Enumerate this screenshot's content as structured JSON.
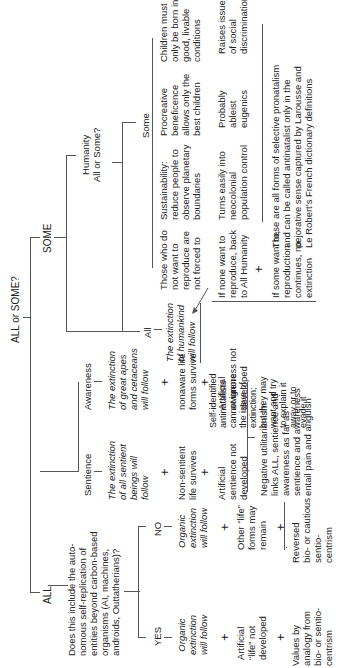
{
  "root": {
    "label": "ALL or SOME?"
  },
  "all": {
    "label": "ALL",
    "question": "Does this include the auto-\nnomous self-replication of\nentities beyond carbon-based\norganisms (AI, machines,\nandroids, Outtatherians)?",
    "yes": {
      "label": "YES",
      "items": [
        "Organic\nextinction\nwill follow",
        "Artificial\n“life” not\ndeveloped",
        "Values by\nanalogy from\nbio- or sentio-\ncentrism"
      ]
    },
    "no": {
      "label": "NO",
      "items": [
        "Organic\nextinction\nwill follow",
        "Other “life”\nforms may\nremain",
        "Reversed\nbio- or cautious\nsentio-\ncentrism"
      ]
    },
    "sentience": {
      "label": "Sentience",
      "items": [
        "The extinction\nof all sentient\nbeings will\nfollow",
        "Non-sentient\nlife survives",
        "Artificial\nsentience not\ndeveloped"
      ]
    },
    "awareness": {
      "label": "Awareness",
      "items": [
        "The extinction\nof great apes\nand cetaceans\nwill follow",
        "nonaware life\nforms survive",
        "Artificial\nawareness not\ndeveloped"
      ]
    },
    "negative_utilitarianism": "Negative utilitarianism\nlinks ALL, sentience and\nawareness as far as\nsentience and awareness\nentail pain and anguish"
  },
  "some": {
    "label": "SOME",
    "humanity": {
      "label": "Humanity\nAll or Some?"
    },
    "all_branch": {
      "label": "All",
      "result": "The extinction\nof humankind\nwill follow",
      "note": "Self-identified\nantinatalists\ncannot ignore\nthe issue of\nextinction;\nbut they may\nwant and try\nto explain it\naway or to\nevade it"
    },
    "some_branch": {
      "label": "Some",
      "options": [
        {
          "text": "Those who do\nnot want to\nreproduce are\nnot forced to"
        },
        {
          "text": "Sustainability:\nreduce people to\nobserve planetary\nboundaries",
          "sub": "Turns easily into\nneocolonial\npopulation control"
        },
        {
          "text": "Procreative\nbeneficence\nallows only the\nbest children",
          "sub": "Probably\nableist\neugenics"
        },
        {
          "text": "Children must\nonly be born into\ngood, livable\nconditions",
          "sub": "Raises issues\nof social\ndiscrimination"
        }
      ],
      "if_none": "If none want to\nreproduce, back\nto All Humanity",
      "if_some": "If some want to,\nreproduction\ncontinues, no\nextinction",
      "summary": "These are all forms of selective pronatalism\nand can be called antinatalist only in the\npejorative sense captured by Larousse and\nLe Robert’s French dictionary definitions"
    }
  },
  "symbols": {
    "plus": "+"
  }
}
